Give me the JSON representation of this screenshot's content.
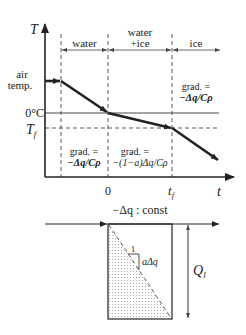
{
  "top_chart": {
    "y_axis_label": "T",
    "x_axis_label": "t",
    "x_ticks": {
      "zero": "0",
      "tf": "t",
      "tf_sub": "f"
    },
    "y_labels": {
      "air_temp_line1": "air",
      "air_temp_line2": "temp.",
      "zero_c": "0°C",
      "tf": "T",
      "tf_sub": "f"
    },
    "phases": {
      "water": "water",
      "water_ice_line1": "water",
      "water_ice_line2": "+ice",
      "ice": "ice"
    },
    "gradients": {
      "water_line1": "grad. =",
      "water_line2": "−Δq/Cρ",
      "water_ice_line1": "grad. =",
      "water_ice_line2": "−(1−a)Δq/Cρ",
      "ice_line1": "grad. =",
      "ice_line2": "−Δq/Cρ"
    }
  },
  "bottom_chart": {
    "title": "−Δq : const",
    "slope_run": "1",
    "slope_rise": "aΔq",
    "latent_label": "Q",
    "latent_sub": "l"
  },
  "colors": {
    "line": "#222222",
    "dashed": "#444444",
    "stipple": "#9a9a9a"
  }
}
